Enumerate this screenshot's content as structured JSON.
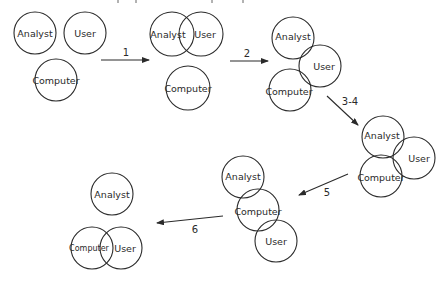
{
  "diagram": {
    "type": "venn-sequence",
    "stages": [
      {
        "id": "stage-0",
        "circles": [
          {
            "label": "Analyst"
          },
          {
            "label": "User"
          },
          {
            "label": "Computer"
          }
        ]
      },
      {
        "id": "stage-1",
        "circles": [
          {
            "label": "Analyst"
          },
          {
            "label": "User"
          },
          {
            "label": "Computer"
          }
        ]
      },
      {
        "id": "stage-2",
        "circles": [
          {
            "label": "Analyst"
          },
          {
            "label": "User"
          },
          {
            "label": "Computer"
          }
        ]
      },
      {
        "id": "stage-3-4",
        "circles": [
          {
            "label": "Analyst"
          },
          {
            "label": "User"
          },
          {
            "label": "Computer"
          }
        ]
      },
      {
        "id": "stage-5",
        "circles": [
          {
            "label": "Analyst"
          },
          {
            "label": "Computer"
          },
          {
            "label": "User"
          }
        ]
      },
      {
        "id": "stage-6",
        "circles": [
          {
            "label": "Analyst"
          },
          {
            "label": "Computer"
          },
          {
            "label": "User"
          }
        ]
      }
    ],
    "transitions": [
      {
        "label": "1"
      },
      {
        "label": "2"
      },
      {
        "label": "3-4"
      },
      {
        "label": "5"
      },
      {
        "label": "6"
      }
    ]
  }
}
